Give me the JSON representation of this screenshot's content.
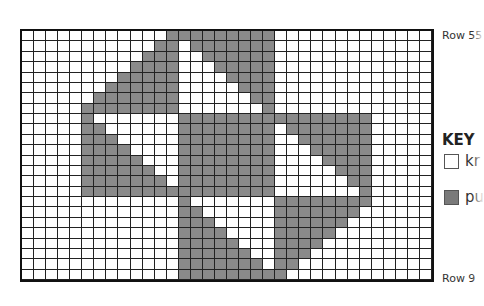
{
  "chart": {
    "rows": 24,
    "cols": 34,
    "top_label": "Row 55",
    "bottom_label": "Row 9",
    "colors": {
      "knit": "#ffffff",
      "purl": "#8a8a8a",
      "grid": "#222222"
    },
    "purl_cells": [
      [
        [
          12,
          20
        ]
      ],
      [
        [
          11,
          12
        ],
        [
          14,
          20
        ]
      ],
      [
        [
          10,
          12
        ],
        [
          15,
          20
        ]
      ],
      [
        [
          9,
          12
        ],
        [
          16,
          20
        ]
      ],
      [
        [
          8,
          12
        ],
        [
          17,
          20
        ]
      ],
      [
        [
          7,
          12
        ],
        [
          18,
          20
        ]
      ],
      [
        [
          6,
          12
        ],
        [
          19,
          20
        ]
      ],
      [
        [
          5,
          12
        ],
        [
          20,
          20
        ]
      ],
      [
        [
          5,
          5
        ],
        [
          13,
          28
        ]
      ],
      [
        [
          5,
          6
        ],
        [
          13,
          20
        ],
        [
          22,
          28
        ]
      ],
      [
        [
          5,
          7
        ],
        [
          13,
          20
        ],
        [
          23,
          28
        ]
      ],
      [
        [
          5,
          8
        ],
        [
          13,
          20
        ],
        [
          24,
          28
        ]
      ],
      [
        [
          5,
          9
        ],
        [
          13,
          20
        ],
        [
          25,
          28
        ]
      ],
      [
        [
          5,
          10
        ],
        [
          13,
          20
        ],
        [
          26,
          28
        ]
      ],
      [
        [
          5,
          11
        ],
        [
          13,
          20
        ],
        [
          27,
          28
        ]
      ],
      [
        [
          5,
          20
        ],
        [
          28,
          28
        ]
      ],
      [
        [
          13,
          13
        ],
        [
          21,
          28
        ]
      ],
      [
        [
          13,
          14
        ],
        [
          21,
          27
        ]
      ],
      [
        [
          13,
          15
        ],
        [
          21,
          26
        ]
      ],
      [
        [
          13,
          16
        ],
        [
          21,
          25
        ]
      ],
      [
        [
          13,
          17
        ],
        [
          21,
          24
        ]
      ],
      [
        [
          13,
          18
        ],
        [
          21,
          23
        ]
      ],
      [
        [
          13,
          19
        ],
        [
          21,
          22
        ]
      ],
      [
        [
          13,
          21
        ]
      ]
    ]
  },
  "key": {
    "title": "KEY",
    "items": [
      {
        "symbol": "white-square",
        "label": "kr"
      },
      {
        "symbol": "gray-square",
        "label": "pu"
      }
    ]
  }
}
